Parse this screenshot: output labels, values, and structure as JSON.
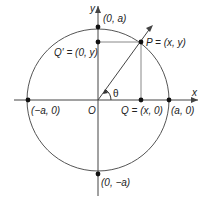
{
  "diagram": {
    "axes": {
      "x_label": "x",
      "y_label": "y"
    },
    "origin_label": "O",
    "angle_label": "θ",
    "points": {
      "top": "(0, a)",
      "bottom": "(0, −a)",
      "left": "(−a, 0)",
      "right": "(a, 0)",
      "P": "P = (x, y)",
      "Q": "Q = (x, 0)",
      "Q_prime": "Q′ = (0, y)"
    },
    "colors": {
      "line": "#333333",
      "thin_line": "#777777",
      "point": "#111111"
    }
  }
}
